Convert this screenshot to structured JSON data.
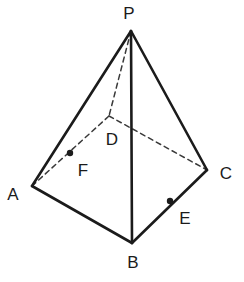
{
  "figure": {
    "kind": "square-pyramid-diagram",
    "title": "",
    "background_color": "#ffffff",
    "stroke_color": "#1b1b1b",
    "hidden_edge_color": "#3a3a3a",
    "solid_stroke_width": 2.6,
    "dashed_stroke_width": 1.5,
    "dash_pattern": "5,4",
    "point_marker_radius": 3.2,
    "canvas": {
      "width": 244,
      "height": 282
    }
  },
  "vertices": [
    {
      "id": "P",
      "label": "P",
      "x": 131,
      "y": 31,
      "hidden": false,
      "label_x": 129,
      "label_y": 13
    },
    {
      "id": "A",
      "label": "A",
      "x": 32,
      "y": 186,
      "hidden": false,
      "label_x": 13,
      "label_y": 194
    },
    {
      "id": "B",
      "label": "B",
      "x": 132,
      "y": 243,
      "hidden": false,
      "label_x": 133,
      "label_y": 262
    },
    {
      "id": "C",
      "label": "C",
      "x": 207,
      "y": 170,
      "hidden": false,
      "label_x": 226,
      "label_y": 173
    },
    {
      "id": "D",
      "label": "D",
      "x": 109,
      "y": 116,
      "hidden": true,
      "label_x": 112,
      "label_y": 139
    }
  ],
  "marked_points": [
    {
      "id": "F",
      "label": "F",
      "x": 70,
      "y": 153,
      "on_segment": "A-D",
      "label_x": 83,
      "label_y": 170
    },
    {
      "id": "E",
      "label": "E",
      "x": 170,
      "y": 201,
      "on_segment": "B-C",
      "label_x": 185,
      "label_y": 218
    }
  ],
  "edges": [
    {
      "id": "PA",
      "from": "P",
      "to": "A",
      "style": "solid"
    },
    {
      "id": "PB",
      "from": "P",
      "to": "B",
      "style": "solid"
    },
    {
      "id": "PC",
      "from": "P",
      "to": "C",
      "style": "solid"
    },
    {
      "id": "PD",
      "from": "P",
      "to": "D",
      "style": "dashed"
    },
    {
      "id": "AB",
      "from": "A",
      "to": "B",
      "style": "solid"
    },
    {
      "id": "BC",
      "from": "B",
      "to": "C",
      "style": "solid"
    },
    {
      "id": "AD",
      "from": "A",
      "to": "D",
      "style": "dashed"
    },
    {
      "id": "DC",
      "from": "D",
      "to": "C",
      "style": "dashed"
    }
  ]
}
